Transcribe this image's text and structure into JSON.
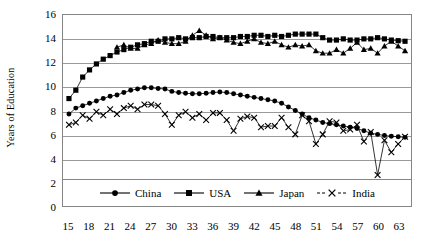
{
  "chart_data": {
    "type": "line",
    "title": "",
    "xlabel": "",
    "ylabel": "Years of Education",
    "ylim": [
      0,
      16
    ],
    "ytick_values": [
      0,
      2,
      4,
      6,
      8,
      10,
      12,
      14,
      16
    ],
    "ytick_labels": [
      "0",
      "2",
      "4",
      "6",
      "8",
      "10",
      "12",
      "14",
      "16"
    ],
    "xlim": [
      15,
      64
    ],
    "xtick_values": [
      15,
      18,
      21,
      24,
      27,
      30,
      33,
      36,
      39,
      42,
      45,
      48,
      51,
      54,
      57,
      60,
      63
    ],
    "xtick_labels": [
      "15",
      "18",
      "21",
      "24",
      "27",
      "30",
      "33",
      "36",
      "39",
      "42",
      "45",
      "48",
      "51",
      "54",
      "57",
      "60",
      "63"
    ],
    "grid": true,
    "grid_axis": "y",
    "legend_position": "bottom-inside",
    "x": [
      15,
      16,
      17,
      18,
      19,
      20,
      21,
      22,
      23,
      24,
      25,
      26,
      27,
      28,
      29,
      30,
      31,
      32,
      33,
      34,
      35,
      36,
      37,
      38,
      39,
      40,
      41,
      42,
      43,
      44,
      45,
      46,
      47,
      48,
      49,
      50,
      51,
      52,
      53,
      54,
      55,
      56,
      57,
      58,
      59,
      60,
      61,
      62,
      63,
      64
    ],
    "series": [
      {
        "name": "China",
        "marker": "circle",
        "color": "#000000",
        "values": [
          7.7,
          8.2,
          8.4,
          8.6,
          8.8,
          9.0,
          9.2,
          9.3,
          9.5,
          9.7,
          9.8,
          9.9,
          9.9,
          9.85,
          9.8,
          9.6,
          9.5,
          9.45,
          9.4,
          9.4,
          9.45,
          9.5,
          9.55,
          9.5,
          9.4,
          9.3,
          9.2,
          9.1,
          9.0,
          8.9,
          8.8,
          8.6,
          8.3,
          8.0,
          7.7,
          7.4,
          7.2,
          7.0,
          6.9,
          6.8,
          6.7,
          6.6,
          6.5,
          6.3,
          6.1,
          6.0,
          5.9,
          5.85,
          5.8,
          5.75
        ]
      },
      {
        "name": "USA",
        "marker": "square",
        "color": "#000000",
        "values": [
          9.0,
          9.7,
          10.8,
          11.4,
          11.9,
          12.3,
          12.6,
          12.9,
          13.1,
          13.3,
          13.5,
          13.6,
          13.8,
          13.8,
          14.0,
          14.0,
          14.1,
          14.0,
          14.1,
          14.1,
          14.2,
          14.2,
          14.1,
          14.1,
          14.1,
          14.2,
          14.2,
          14.3,
          14.3,
          14.2,
          14.3,
          14.2,
          14.3,
          14.4,
          14.4,
          14.4,
          14.4,
          14.1,
          13.9,
          13.9,
          14.0,
          13.9,
          13.9,
          14.0,
          14.0,
          14.1,
          14.0,
          13.9,
          13.85,
          13.8
        ]
      },
      {
        "name": "Japan",
        "marker": "triangle",
        "color": "#000000",
        "values": [
          null,
          null,
          null,
          null,
          null,
          null,
          null,
          13.3,
          13.5,
          13.2,
          13.2,
          13.5,
          13.6,
          13.9,
          13.7,
          13.6,
          13.6,
          13.8,
          14.3,
          14.7,
          14.3,
          14.0,
          14.1,
          13.9,
          13.7,
          13.6,
          13.8,
          14.0,
          13.7,
          13.6,
          13.8,
          13.5,
          13.3,
          13.5,
          13.4,
          13.5,
          13.0,
          12.8,
          12.8,
          13.1,
          12.8,
          13.2,
          13.7,
          13.1,
          13.2,
          12.8,
          13.4,
          13.8,
          13.4,
          13.0
        ]
      },
      {
        "name": "India",
        "marker": "x",
        "color": "#000000",
        "values": [
          6.8,
          7.0,
          7.6,
          7.3,
          7.9,
          7.6,
          8.1,
          7.7,
          8.2,
          8.4,
          8.1,
          8.5,
          8.5,
          8.4,
          7.7,
          6.8,
          7.6,
          7.9,
          7.4,
          7.7,
          7.2,
          7.8,
          7.8,
          7.2,
          6.3,
          7.3,
          7.5,
          7.4,
          6.6,
          6.7,
          6.7,
          7.4,
          6.6,
          6.0,
          7.6,
          7.1,
          5.2,
          6.0,
          7.1,
          7.0,
          6.3,
          6.4,
          6.8,
          5.4,
          6.2,
          2.6,
          5.5,
          4.5,
          5.2,
          5.8
        ]
      }
    ]
  },
  "legend": {
    "items": [
      {
        "label": "China",
        "marker": "circle"
      },
      {
        "label": "USA",
        "marker": "square"
      },
      {
        "label": "Japan",
        "marker": "triangle"
      },
      {
        "label": "India",
        "marker": "x"
      }
    ]
  }
}
